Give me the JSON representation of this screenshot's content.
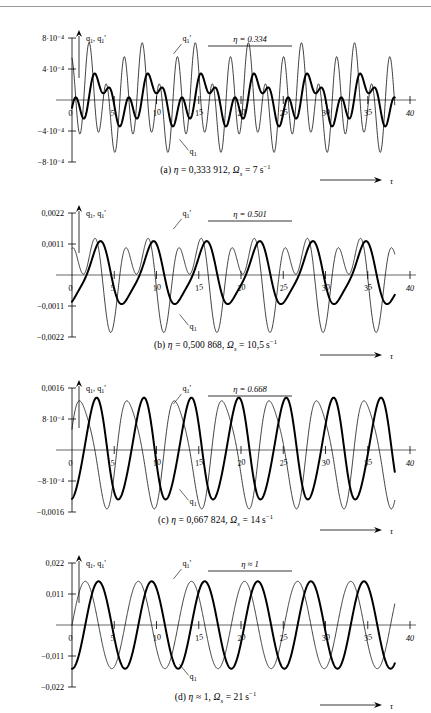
{
  "figure": {
    "y_axis_name": "q₁, q₁′",
    "x_axis_name": "τ",
    "curve_labels": {
      "displacement": "q₁",
      "velocity": "q₁′"
    }
  },
  "chart_data": [
    {
      "id": "a",
      "type": "line",
      "title": "",
      "xlabel": "τ",
      "ylabel": "q₁, q₁′",
      "annotation": "η = 0.334",
      "caption": "(a) η = 0,333 912, Ωₛ = 7 s⁻¹",
      "caption_parts": {
        "index": "(a)",
        "eta_value": "0,333 912",
        "omega_value": "7",
        "omega_unit": "s⁻¹"
      },
      "xlim": [
        0,
        40
      ],
      "ylim": [
        -0.0008,
        0.0008
      ],
      "xticks": [
        0,
        5,
        10,
        15,
        20,
        25,
        30,
        35,
        40
      ],
      "yticks": [
        0.0008,
        0.0004,
        -0.0004,
        -0.0008
      ],
      "ytick_labels": [
        "8·10⁻⁴",
        "4·10⁻⁴",
        "−4·10⁻⁴",
        "−8·10⁻⁴"
      ],
      "grid": false,
      "legend_position": "inline-annotations",
      "series": [
        {
          "name": "q₁",
          "style": "thick",
          "components": [
            {
              "amp": 0.00021,
              "omega": 1.0,
              "phase": -1.5708
            },
            {
              "amp": 0.00016,
              "omega": 3.0,
              "phase": 0.3
            },
            {
              "amp": 7e-05,
              "omega": 2.0,
              "phase": 1.1
            }
          ]
        },
        {
          "name": "q₁′",
          "style": "thin",
          "components": [
            {
              "amp": 0.00022,
              "omega": 1.0,
              "phase": 0.0
            },
            {
              "amp": 0.0005,
              "omega": 3.0,
              "phase": 1.8708
            },
            {
              "amp": 0.00012,
              "omega": 2.0,
              "phase": 2.6
            }
          ]
        }
      ]
    },
    {
      "id": "b",
      "type": "line",
      "title": "",
      "xlabel": "τ",
      "ylabel": "q₁, q₁′",
      "annotation": "η = 0.501",
      "caption": "(b) η = 0,500 868, Ωₛ = 10,5 s⁻¹",
      "caption_parts": {
        "index": "(b)",
        "eta_value": "0,500 868",
        "omega_value": "10,5",
        "omega_unit": "s⁻¹"
      },
      "xlim": [
        0,
        40
      ],
      "ylim": [
        -0.0022,
        0.0022
      ],
      "xticks": [
        0,
        5,
        10,
        15,
        20,
        25,
        30,
        35,
        40
      ],
      "yticks": [
        0.0022,
        0.0011,
        -0.0011,
        -0.0022
      ],
      "ytick_labels": [
        "0,0022",
        "0,0011",
        "−0,0011",
        "−0,0022"
      ],
      "grid": false,
      "legend_position": "inline-annotations",
      "series": [
        {
          "name": "q₁",
          "style": "thick",
          "components": [
            {
              "amp": 0.00105,
              "omega": 1.0,
              "phase": -1.5708
            },
            {
              "amp": 0.00022,
              "omega": 2.0,
              "phase": 0.5
            }
          ]
        },
        {
          "name": "q₁′",
          "style": "thin",
          "components": [
            {
              "amp": 0.00105,
              "omega": 1.0,
              "phase": 0.0
            },
            {
              "amp": 0.001,
              "omega": 2.0,
              "phase": 1.9
            }
          ]
        }
      ]
    },
    {
      "id": "c",
      "type": "line",
      "title": "",
      "xlabel": "τ",
      "ylabel": "q₁, q₁′",
      "annotation": "η = 0.668",
      "caption": "(c) η = 0,667 824, Ωₛ = 14 s⁻¹",
      "caption_parts": {
        "index": "(c)",
        "eta_value": "0,667 824",
        "omega_value": "14",
        "omega_unit": "s⁻¹"
      },
      "xlim": [
        0,
        40
      ],
      "ylim": [
        -0.0016,
        0.0016
      ],
      "xticks": [
        0,
        5,
        10,
        15,
        20,
        25,
        30,
        35,
        40
      ],
      "yticks": [
        0.0016,
        0.0008,
        -0.0008,
        -0.0016
      ],
      "ytick_labels": [
        "0,0016",
        "8·10⁻⁴",
        "−8·10⁻⁴",
        "−0,0016"
      ],
      "grid": false,
      "legend_position": "inline-annotations",
      "series": [
        {
          "name": "q₁",
          "style": "thick",
          "components": [
            {
              "amp": 0.0013,
              "omega": 1.12,
              "phase": -1.5708
            },
            {
              "amp": 0.0001,
              "omega": 2.24,
              "phase": 0.4
            }
          ]
        },
        {
          "name": "q₁′",
          "style": "thin",
          "components": [
            {
              "amp": 0.00135,
              "omega": 1.12,
              "phase": 0.25
            },
            {
              "amp": 0.00022,
              "omega": 2.24,
              "phase": 1.2
            }
          ]
        }
      ]
    },
    {
      "id": "d",
      "type": "line",
      "title": "",
      "xlabel": "τ",
      "ylabel": "q₁, q₁′",
      "annotation": "η ≈ 1",
      "caption": "(d) η ≈ 1, Ωₛ = 21 s⁻¹",
      "caption_parts": {
        "index": "(d)",
        "eta_value": "≈ 1",
        "omega_value": "21",
        "omega_unit": "s⁻¹"
      },
      "xlim": [
        0,
        40
      ],
      "ylim": [
        -0.022,
        0.022
      ],
      "xticks": [
        0,
        5,
        10,
        15,
        20,
        25,
        30,
        35,
        40
      ],
      "yticks": [
        0.022,
        0.011,
        -0.011,
        -0.022
      ],
      "ytick_labels": [
        "0,022",
        "0,011",
        "−0,011",
        "−0,022"
      ],
      "grid": false,
      "legend_position": "inline-annotations",
      "series": [
        {
          "name": "q₁",
          "style": "thick",
          "components": [
            {
              "amp": 0.0155,
              "omega": 1.0,
              "phase": -1.5708
            }
          ]
        },
        {
          "name": "q₁′",
          "style": "thin",
          "components": [
            {
              "amp": 0.0155,
              "omega": 1.0,
              "phase": 0.0
            }
          ]
        }
      ]
    }
  ]
}
